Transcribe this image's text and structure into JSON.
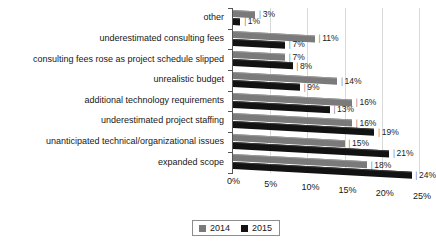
{
  "chart_data": {
    "type": "bar",
    "orientation": "horizontal",
    "title": "",
    "xlabel": "",
    "ylabel": "",
    "grid": true,
    "legend_position": "bottom",
    "xlim": [
      0,
      25
    ],
    "xticks": [
      "0%",
      "5%",
      "10%",
      "15%",
      "20%",
      "25%"
    ],
    "xtick_values": [
      0,
      5,
      10,
      15,
      20,
      25
    ],
    "categories": [
      "other",
      "underestimated consulting fees",
      "consulting fees rose as project schedule slipped",
      "unrealistic budget",
      "additional technology requirements",
      "underestimated project staffing",
      "unanticipated technical/organizational issues",
      "expanded scope"
    ],
    "series": [
      {
        "name": "2014",
        "color": "#7a7a7a",
        "values": [
          3,
          11,
          7,
          14,
          16,
          16,
          15,
          18
        ],
        "labels": [
          "3%",
          "11%",
          "7%",
          "14%",
          "16%",
          "16%",
          "15%",
          "18%"
        ]
      },
      {
        "name": "2015",
        "color": "#121212",
        "values": [
          1,
          7,
          8,
          9,
          13,
          19,
          21,
          24
        ],
        "labels": [
          "1%",
          "7%",
          "8%",
          "9%",
          "13%",
          "19%",
          "21%",
          "24%"
        ]
      }
    ]
  },
  "legend": {
    "items": [
      {
        "label": "2014",
        "color": "#7a7a7a"
      },
      {
        "label": "2015",
        "color": "#121212"
      }
    ]
  }
}
